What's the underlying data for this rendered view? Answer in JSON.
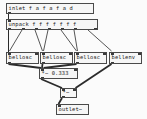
{
  "patch": {
    "canvas": {
      "width": 147,
      "height": 119,
      "background_color": "#fbfbfb",
      "box_fill_color": "#f6f6f6",
      "box_border_color": "#4a4a4a",
      "cord_color": "#2b2b2b",
      "text_color": "#1a1a1a"
    },
    "objects": [
      {
        "id": "inlet",
        "text": "inlet f a f a f a d",
        "x": 6,
        "y": 3,
        "w": 88,
        "h": 11
      },
      {
        "id": "unpack",
        "text": "unpack f f f f f f f",
        "x": 6,
        "y": 19,
        "w": 92,
        "h": 11
      },
      {
        "id": "bellosc1",
        "text": "bellosc",
        "x": 6,
        "y": 52,
        "w": 33,
        "h": 12
      },
      {
        "id": "bellosc2",
        "text": "bellosc",
        "x": 40,
        "y": 52,
        "w": 33,
        "h": 12
      },
      {
        "id": "bellosc3",
        "text": "bellosc",
        "x": 74,
        "y": 52,
        "w": 33,
        "h": 12
      },
      {
        "id": "bellenv",
        "text": "bellenv",
        "x": 109,
        "y": 52,
        "w": 33,
        "h": 12
      },
      {
        "id": "mult-scale",
        "text": "*~ 0.333",
        "x": 39,
        "y": 68,
        "w": 39,
        "h": 11
      },
      {
        "id": "mult-env",
        "text": "*~",
        "x": 60,
        "y": 88,
        "w": 17,
        "h": 10
      },
      {
        "id": "outlet",
        "text": "outlet~",
        "x": 56,
        "y": 104,
        "w": 33,
        "h": 11
      }
    ],
    "cords": [
      {
        "from": "inlet",
        "to": "unpack",
        "type": "message"
      },
      {
        "from": "unpack",
        "to": "bellosc1",
        "type": "message"
      },
      {
        "from": "unpack",
        "to": "bellosc2",
        "type": "message"
      },
      {
        "from": "unpack",
        "to": "bellosc3",
        "type": "message"
      },
      {
        "from": "unpack",
        "to": "bellenv",
        "type": "message"
      },
      {
        "from": "bellosc1",
        "to": "mult-scale",
        "type": "signal"
      },
      {
        "from": "bellosc2",
        "to": "mult-scale",
        "type": "signal"
      },
      {
        "from": "bellosc3",
        "to": "mult-scale",
        "type": "signal"
      },
      {
        "from": "mult-scale",
        "to": "mult-env",
        "type": "signal"
      },
      {
        "from": "bellenv",
        "to": "mult-env",
        "type": "signal"
      },
      {
        "from": "mult-env",
        "to": "outlet",
        "type": "signal"
      }
    ]
  }
}
